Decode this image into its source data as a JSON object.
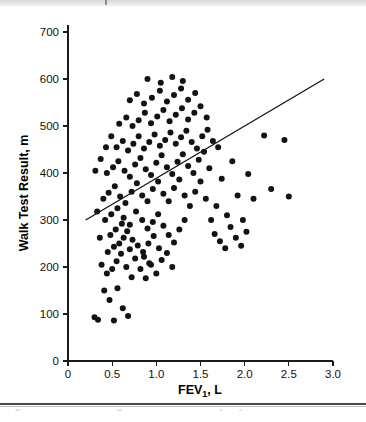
{
  "figure": {
    "caption_fragment": "Figure 1. Association of lung function and exercise capacity."
  },
  "chart_data": {
    "type": "scatter",
    "title": "",
    "xlabel": "FEV1, L",
    "ylabel": "Walk Test Result, m",
    "xlim": [
      0,
      3.0
    ],
    "ylim": [
      0,
      700
    ],
    "xticks": [
      0,
      0.5,
      1.0,
      1.5,
      2.0,
      2.5,
      3.0
    ],
    "xtick_labels": [
      "0",
      "0.5",
      "1.0",
      "1.5",
      "2.0",
      "2.5",
      "3.0"
    ],
    "yticks": [
      0,
      100,
      200,
      300,
      400,
      500,
      600,
      700
    ],
    "ytick_labels": [
      "0",
      "100",
      "200",
      "300",
      "400",
      "500",
      "600",
      "700"
    ],
    "grid": false,
    "legend": null,
    "marker": {
      "shape": "circle",
      "color": "#131313",
      "size": 3.0
    },
    "trendline": {
      "type": "linear",
      "color": "#151515",
      "x_start": 0.2,
      "y_start": 300,
      "x_end": 2.9,
      "y_end": 600
    },
    "n_points": 165,
    "points": [
      [
        0.3,
        93
      ],
      [
        0.34,
        88
      ],
      [
        0.52,
        86
      ],
      [
        0.47,
        130
      ],
      [
        0.41,
        150
      ],
      [
        0.56,
        155
      ],
      [
        0.62,
        112
      ],
      [
        0.68,
        96
      ],
      [
        0.44,
        186
      ],
      [
        0.5,
        196
      ],
      [
        0.38,
        205
      ],
      [
        0.55,
        212
      ],
      [
        0.6,
        228
      ],
      [
        0.66,
        200
      ],
      [
        0.72,
        178
      ],
      [
        0.45,
        232
      ],
      [
        0.52,
        243
      ],
      [
        0.58,
        250
      ],
      [
        0.63,
        262
      ],
      [
        0.7,
        238
      ],
      [
        0.76,
        218
      ],
      [
        0.82,
        196
      ],
      [
        0.88,
        176
      ],
      [
        0.94,
        205
      ],
      [
        1.0,
        186
      ],
      [
        0.48,
        268
      ],
      [
        0.54,
        280
      ],
      [
        0.61,
        292
      ],
      [
        0.67,
        276
      ],
      [
        0.73,
        258
      ],
      [
        0.79,
        246
      ],
      [
        0.85,
        232
      ],
      [
        0.91,
        250
      ],
      [
        0.97,
        266
      ],
      [
        1.03,
        240
      ],
      [
        0.42,
        300
      ],
      [
        0.49,
        312
      ],
      [
        0.56,
        325
      ],
      [
        0.63,
        305
      ],
      [
        0.7,
        290
      ],
      [
        0.77,
        318
      ],
      [
        0.84,
        300
      ],
      [
        0.9,
        282
      ],
      [
        0.96,
        296
      ],
      [
        1.02,
        312
      ],
      [
        1.08,
        288
      ],
      [
        1.14,
        268
      ],
      [
        1.2,
        252
      ],
      [
        1.26,
        280
      ],
      [
        1.32,
        300
      ],
      [
        0.4,
        345
      ],
      [
        0.46,
        358
      ],
      [
        0.53,
        372
      ],
      [
        0.59,
        350
      ],
      [
        0.65,
        336
      ],
      [
        0.72,
        360
      ],
      [
        0.78,
        378
      ],
      [
        0.84,
        352
      ],
      [
        0.9,
        340
      ],
      [
        0.96,
        366
      ],
      [
        1.02,
        382
      ],
      [
        1.08,
        356
      ],
      [
        1.14,
        340
      ],
      [
        1.2,
        368
      ],
      [
        1.26,
        386
      ],
      [
        1.32,
        352
      ],
      [
        1.38,
        330
      ],
      [
        1.44,
        360
      ],
      [
        1.5,
        382
      ],
      [
        1.56,
        345
      ],
      [
        0.44,
        400
      ],
      [
        0.51,
        412
      ],
      [
        0.57,
        425
      ],
      [
        0.64,
        405
      ],
      [
        0.7,
        392
      ],
      [
        0.76,
        418
      ],
      [
        0.82,
        432
      ],
      [
        0.88,
        408
      ],
      [
        0.94,
        396
      ],
      [
        1.0,
        422
      ],
      [
        1.06,
        438
      ],
      [
        1.12,
        412
      ],
      [
        1.18,
        398
      ],
      [
        1.24,
        424
      ],
      [
        1.3,
        440
      ],
      [
        1.36,
        415
      ],
      [
        1.42,
        400
      ],
      [
        1.48,
        428
      ],
      [
        1.54,
        445
      ],
      [
        1.6,
        410
      ],
      [
        0.55,
        455
      ],
      [
        0.62,
        468
      ],
      [
        0.68,
        448
      ],
      [
        0.74,
        462
      ],
      [
        0.8,
        478
      ],
      [
        0.86,
        452
      ],
      [
        0.92,
        466
      ],
      [
        0.98,
        482
      ],
      [
        1.04,
        458
      ],
      [
        1.1,
        470
      ],
      [
        1.16,
        486
      ],
      [
        1.22,
        462
      ],
      [
        1.28,
        476
      ],
      [
        1.34,
        490
      ],
      [
        1.4,
        466
      ],
      [
        1.46,
        452
      ],
      [
        1.52,
        478
      ],
      [
        1.58,
        492
      ],
      [
        1.64,
        468
      ],
      [
        1.7,
        455
      ],
      [
        0.58,
        505
      ],
      [
        0.66,
        518
      ],
      [
        0.73,
        500
      ],
      [
        0.8,
        512
      ],
      [
        0.87,
        528
      ],
      [
        0.94,
        506
      ],
      [
        1.01,
        520
      ],
      [
        1.08,
        534
      ],
      [
        1.15,
        510
      ],
      [
        1.22,
        524
      ],
      [
        1.29,
        538
      ],
      [
        1.36,
        514
      ],
      [
        1.43,
        528
      ],
      [
        1.5,
        542
      ],
      [
        1.57,
        518
      ],
      [
        0.7,
        555
      ],
      [
        0.78,
        568
      ],
      [
        0.86,
        548
      ],
      [
        0.95,
        560
      ],
      [
        1.04,
        575
      ],
      [
        1.12,
        552
      ],
      [
        1.2,
        566
      ],
      [
        1.28,
        580
      ],
      [
        1.36,
        556
      ],
      [
        1.44,
        570
      ],
      [
        0.9,
        600
      ],
      [
        1.05,
        592
      ],
      [
        1.18,
        604
      ],
      [
        1.3,
        596
      ],
      [
        1.68,
        330
      ],
      [
        1.74,
        388
      ],
      [
        1.8,
        310
      ],
      [
        1.86,
        425
      ],
      [
        1.92,
        352
      ],
      [
        1.98,
        300
      ],
      [
        2.04,
        398
      ],
      [
        2.1,
        345
      ],
      [
        2.22,
        480
      ],
      [
        2.3,
        366
      ],
      [
        2.45,
        470
      ],
      [
        2.5,
        350
      ],
      [
        1.62,
        300
      ],
      [
        1.66,
        270
      ],
      [
        1.72,
        255
      ],
      [
        1.78,
        240
      ],
      [
        1.84,
        285
      ],
      [
        1.9,
        262
      ],
      [
        1.96,
        245
      ],
      [
        2.02,
        275
      ],
      [
        0.36,
        262
      ],
      [
        0.33,
        318
      ],
      [
        0.31,
        405
      ],
      [
        0.37,
        430
      ],
      [
        0.43,
        455
      ],
      [
        0.49,
        478
      ],
      [
        0.86,
        222
      ],
      [
        0.92,
        208
      ],
      [
        1.06,
        215
      ],
      [
        1.12,
        230
      ],
      [
        1.18,
        200
      ]
    ]
  }
}
